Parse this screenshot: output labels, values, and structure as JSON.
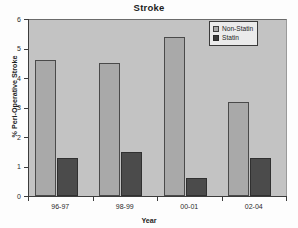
{
  "chart_data": {
    "type": "bar",
    "title": "Stroke",
    "xlabel": "Year",
    "ylabel": "% Peri-Operative Stroke",
    "categories": [
      "96-97",
      "98-99",
      "00-01",
      "02-04"
    ],
    "series": [
      {
        "name": "Non-Statin",
        "values": [
          4.6,
          4.5,
          5.4,
          3.2
        ],
        "color": "#a9a9a9"
      },
      {
        "name": "Statin",
        "values": [
          1.3,
          1.5,
          0.6,
          1.3
        ],
        "color": "#4b4b4b"
      }
    ],
    "ylim": [
      0,
      6
    ],
    "yticks": [
      0,
      1,
      2,
      3,
      4,
      5,
      6
    ],
    "ytick_labels": [
      "0",
      "1",
      "2",
      "3",
      "4",
      "5",
      "6"
    ],
    "grid": false,
    "legend_position": "top-right",
    "plot_background": "#c3c3c3"
  }
}
